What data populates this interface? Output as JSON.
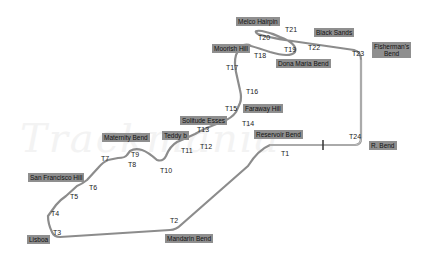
{
  "map": {
    "title": "",
    "watermark": "Trackmania",
    "track_color": "#8c8c8c",
    "label_bg_color": "#8f8f8f",
    "turns": [
      {
        "id": "T1",
        "label": "T1",
        "x": 281,
        "y": 150
      },
      {
        "id": "T2",
        "label": "T2",
        "x": 170,
        "y": 217
      },
      {
        "id": "T3",
        "label": "T3",
        "x": 53,
        "y": 229
      },
      {
        "id": "T4",
        "label": "T4",
        "x": 51,
        "y": 210
      },
      {
        "id": "T5",
        "label": "T5",
        "x": 70,
        "y": 193
      },
      {
        "id": "T6",
        "label": "T6",
        "x": 89,
        "y": 184
      },
      {
        "id": "T7",
        "label": "T7",
        "x": 101,
        "y": 155
      },
      {
        "id": "T8",
        "label": "T8",
        "x": 128,
        "y": 161
      },
      {
        "id": "T9",
        "label": "T9",
        "x": 131,
        "y": 151
      },
      {
        "id": "T10",
        "label": "T10",
        "x": 160,
        "y": 167
      },
      {
        "id": "T11",
        "label": "T11",
        "x": 181,
        "y": 147
      },
      {
        "id": "T12",
        "label": "T12",
        "x": 200,
        "y": 143
      },
      {
        "id": "T13",
        "label": "T13",
        "x": 197,
        "y": 126
      },
      {
        "id": "T14",
        "label": "T14",
        "x": 242,
        "y": 120
      },
      {
        "id": "T15",
        "label": "T15",
        "x": 225,
        "y": 105
      },
      {
        "id": "T16",
        "label": "T16",
        "x": 246,
        "y": 88
      },
      {
        "id": "T17",
        "label": "T17",
        "x": 226,
        "y": 64
      },
      {
        "id": "T18",
        "label": "T18",
        "x": 254,
        "y": 52
      },
      {
        "id": "T19",
        "label": "T19",
        "x": 284,
        "y": 46
      },
      {
        "id": "T20",
        "label": "T20",
        "x": 258,
        "y": 34
      },
      {
        "id": "T21",
        "label": "T21",
        "x": 285,
        "y": 26
      },
      {
        "id": "T22",
        "label": "T22",
        "x": 308,
        "y": 44
      },
      {
        "id": "T23",
        "label": "T23",
        "x": 352,
        "y": 50
      },
      {
        "id": "T24",
        "label": "T24",
        "x": 349,
        "y": 133
      }
    ],
    "corners": [
      {
        "id": "melco-hairpin",
        "label": "Melco Hairpin",
        "x": 236,
        "y": 17
      },
      {
        "id": "black-sands",
        "label": "Black Sands",
        "x": 314,
        "y": 28
      },
      {
        "id": "fishermans-bend",
        "label": "Fisherman's\nBend",
        "x": 372,
        "y": 42
      },
      {
        "id": "moorish-hill",
        "label": "Moorish Hill",
        "x": 212,
        "y": 44
      },
      {
        "id": "dona-maria-bend",
        "label": "Dona Maria Bend",
        "x": 276,
        "y": 59
      },
      {
        "id": "faraway-hill",
        "label": "Faraway Hill",
        "x": 243,
        "y": 104
      },
      {
        "id": "solitude-esses",
        "label": "Solitude Esses",
        "x": 180,
        "y": 116
      },
      {
        "id": "teddy-b",
        "label": "Teddy b",
        "x": 162,
        "y": 131
      },
      {
        "id": "reservoir-bend",
        "label": "Reservoir Bend",
        "x": 254,
        "y": 130
      },
      {
        "id": "maternity-bend",
        "label": "Maternity Bend",
        "x": 102,
        "y": 133
      },
      {
        "id": "r-bend",
        "label": "R. Bend",
        "x": 369,
        "y": 141
      },
      {
        "id": "san-francisco-hill",
        "label": "San Francisco Hill",
        "x": 28,
        "y": 173
      },
      {
        "id": "lisboa",
        "label": "Lisboa",
        "x": 27,
        "y": 235
      },
      {
        "id": "mandarin-bend",
        "label": "Mandarin Bend",
        "x": 165,
        "y": 234
      }
    ],
    "start_finish": {
      "label": "S/F",
      "x": 322,
      "y": 145
    }
  }
}
